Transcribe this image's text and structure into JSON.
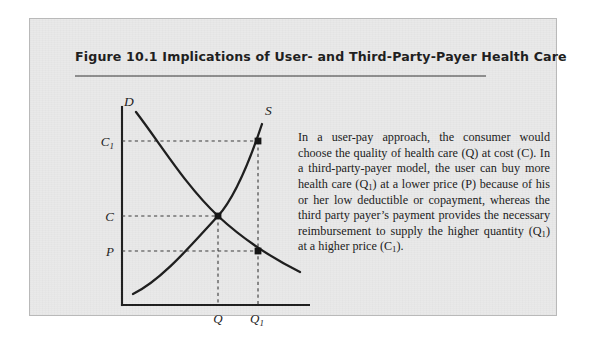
{
  "figure": {
    "title": "Figure 10.1  Implications of User- and Third-Party-Payer Health Care",
    "caption_runs": [
      {
        "t": "In a user-pay approach, the consumer would choose the quality of health care (Q) at cost (C). In a third-party-payer model, the user can buy more health care (Q"
      },
      {
        "t": "1",
        "sub": true
      },
      {
        "t": ") at a lower price (P) because of his or her low deductible or copayment, whereas the third party payer’s payment provides the necessary reimbursement to supply the higher quantity (Q"
      },
      {
        "t": "1",
        "sub": true
      },
      {
        "t": ") at a higher price (C"
      },
      {
        "t": "1",
        "sub": true
      },
      {
        "t": ")."
      }
    ],
    "caption_plain": "In a user-pay approach, the consumer would choose the quality of health care (Q) at cost (C). In a third-party-payer model, the user can buy more health care (Q1) at a lower price (P) because of his or her low deductible or copayment, whereas the third party payer's payment provides the necessary reimbursement to supply the higher quantity (Q1) at a higher price (C1)."
  },
  "colors": {
    "page_background": "#ffffff",
    "figure_background": "#e9e9e9",
    "figure_border": "#b9b9b9",
    "ink": "#1d1d1d",
    "rule": "#8e8e8e",
    "dashed_guide": "#3a3a3a"
  },
  "chart_data": {
    "type": "line",
    "title": "Implications of User- and Third-Party-Payer Health Care",
    "xlabel": "",
    "ylabel": "",
    "grid": false,
    "legend": "inline-curve-labels",
    "axis": {
      "x_tick_labels": [
        "Q",
        "Q1"
      ],
      "x_tick_display": [
        "Q",
        "Q₁"
      ],
      "y_tick_labels": [
        "P",
        "C",
        "C1"
      ],
      "y_tick_display": [
        "P",
        "C",
        "C₁"
      ],
      "x_tick_positions": [
        0.52,
        0.72
      ],
      "y_tick_positions": [
        0.27,
        0.45,
        0.83
      ]
    },
    "series": [
      {
        "name": "D",
        "label": "D",
        "description": "Demand curve, downward sloping convex",
        "label_position": {
          "x": 0.2,
          "y": 0.955
        },
        "points": [
          {
            "x": 0.155,
            "y": 0.935
          },
          {
            "x": 0.3,
            "y": 0.73
          },
          {
            "x": 0.42,
            "y": 0.57
          },
          {
            "x": 0.52,
            "y": 0.45
          },
          {
            "x": 0.62,
            "y": 0.345
          },
          {
            "x": 0.72,
            "y": 0.27
          },
          {
            "x": 0.82,
            "y": 0.215
          },
          {
            "x": 0.875,
            "y": 0.175
          }
        ]
      },
      {
        "name": "S",
        "label": "S",
        "description": "Supply curve, upward sloping",
        "label_position": {
          "x": 0.755,
          "y": 0.965
        },
        "points": [
          {
            "x": 0.06,
            "y": 0.06
          },
          {
            "x": 0.22,
            "y": 0.175
          },
          {
            "x": 0.36,
            "y": 0.29
          },
          {
            "x": 0.52,
            "y": 0.45
          },
          {
            "x": 0.63,
            "y": 0.62
          },
          {
            "x": 0.72,
            "y": 0.83
          },
          {
            "x": 0.755,
            "y": 0.925
          }
        ]
      }
    ],
    "marked_points": [
      {
        "name": "equilibrium",
        "x_label": "Q",
        "y_label": "C",
        "x": 0.52,
        "y": 0.45
      },
      {
        "name": "demand-at-low-price",
        "x_label": "Q1",
        "y_label": "P",
        "x": 0.72,
        "y": 0.27
      },
      {
        "name": "supply-at-high-cost",
        "x_label": "Q1",
        "y_label": "C1",
        "x": 0.72,
        "y": 0.83
      }
    ],
    "guides": [
      {
        "type": "horizontal",
        "from_label": "C1",
        "to_point": "supply-at-high-cost",
        "y": 0.83
      },
      {
        "type": "horizontal",
        "from_label": "C",
        "to_point": "equilibrium",
        "y": 0.45
      },
      {
        "type": "horizontal",
        "from_label": "P",
        "to_point": "demand-at-low-price",
        "y": 0.27
      },
      {
        "type": "vertical",
        "from_label": "Q",
        "to_point": "equilibrium",
        "x": 0.52
      },
      {
        "type": "vertical",
        "from_label": "Q1",
        "to_point": "supply-at-high-cost",
        "x": 0.72
      }
    ]
  }
}
